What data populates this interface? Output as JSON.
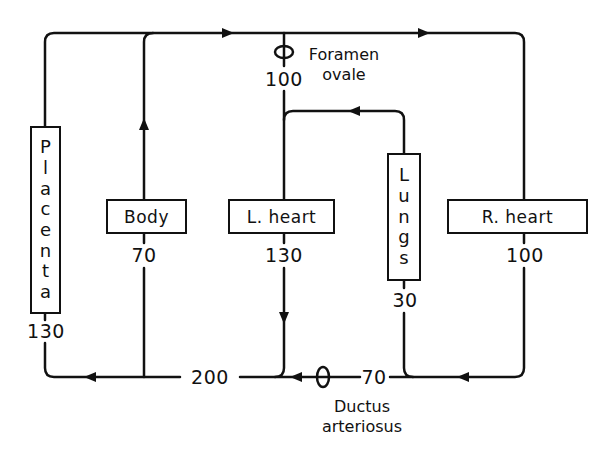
{
  "diagram": {
    "line_color": "#111111",
    "background": "#ffffff",
    "nodes": {
      "placenta": {
        "label": "Placenta",
        "letters": [
          "P",
          "l",
          "a",
          "c",
          "e",
          "n",
          "t",
          "a"
        ],
        "value": "130"
      },
      "body": {
        "label": "Body",
        "value": "70"
      },
      "l_heart": {
        "label": "L. heart",
        "value": "130"
      },
      "lungs": {
        "label": "Lungs",
        "letters": [
          "L",
          "u",
          "n",
          "g",
          "s"
        ],
        "value": "30"
      },
      "r_heart": {
        "label": "R. heart",
        "value": "100"
      }
    },
    "shunts": {
      "foramen_ovale": {
        "line1": "Foramen",
        "line2": "ovale",
        "value": "100"
      },
      "ductus_arteriosus": {
        "line1": "Ductus",
        "line2": "arteriosus",
        "value": "70"
      }
    },
    "bottom_trunk": {
      "value": "200"
    }
  }
}
